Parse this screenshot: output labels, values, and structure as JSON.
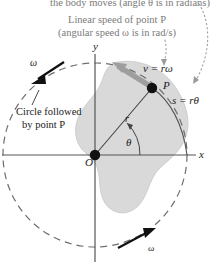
{
  "figure": {
    "captions": {
      "top_line": "the body moves (angle θ is in radians)",
      "linear_speed_line1": "Linear speed of point P",
      "linear_speed_line2": "(angular speed ω is in rad/s)",
      "circle_line1": "Circle followed",
      "circle_line2": "by point P"
    },
    "axes": {
      "y_label": "y",
      "x_label": "x",
      "origin_label": "O"
    },
    "labels": {
      "velocity": "v = rω",
      "point": "P",
      "arc": "s = rθ",
      "radius": "r",
      "angle": "θ",
      "omega_top": "ω",
      "omega_bottom": "ω"
    },
    "colors": {
      "background": "#ffffff",
      "caption_gray": "#7a7a7a",
      "ink": "#1a1a1a",
      "body_fill": "#d9d9d9",
      "body_stroke": "#c2c2c2",
      "axis": "#555555",
      "dashed_circle": "#6e6e6e",
      "velocity_arrow": "#9a9a9a",
      "leader_dotted": "#9a9a9a"
    },
    "geometry": {
      "origin_x": 95,
      "origin_y": 155,
      "circle_radius": 92,
      "point_p_x": 152,
      "point_p_y": 88,
      "arc_end_x": 187,
      "arc_end_y": 155
    }
  }
}
